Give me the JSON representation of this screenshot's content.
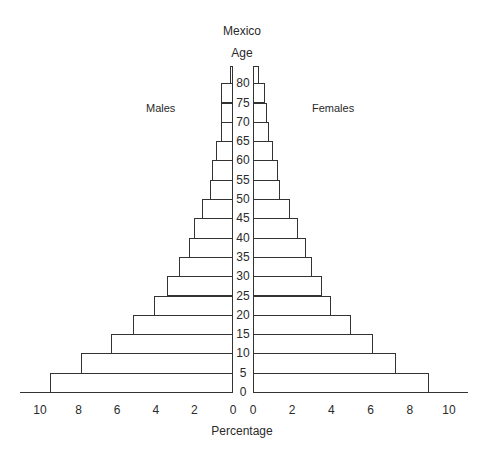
{
  "chart_data": {
    "type": "bar",
    "subtype": "population-pyramid",
    "title": "Mexico",
    "center_axis_label": "Age",
    "xlabel": "Percentage",
    "left_label": "Males",
    "right_label": "Females",
    "age_ticks": [
      "0",
      "5",
      "10",
      "15",
      "20",
      "25",
      "30",
      "35",
      "40",
      "45",
      "50",
      "55",
      "60",
      "65",
      "70",
      "75",
      "80"
    ],
    "x_ticks_left": [
      "10",
      "8",
      "6",
      "4",
      "2",
      "0"
    ],
    "x_ticks_right": [
      "0",
      "2",
      "4",
      "6",
      "8",
      "10"
    ],
    "xlim": [
      0,
      10
    ],
    "categories": [
      "0-4",
      "5-9",
      "10-14",
      "15-19",
      "20-24",
      "25-29",
      "30-34",
      "35-39",
      "40-44",
      "45-49",
      "50-54",
      "55-59",
      "60-64",
      "65-69",
      "70-74",
      "75-79",
      "80+"
    ],
    "series": [
      {
        "name": "Males",
        "values": [
          9.5,
          7.9,
          6.3,
          5.2,
          4.1,
          3.4,
          2.8,
          2.3,
          2.0,
          1.6,
          1.2,
          1.1,
          0.9,
          0.6,
          0.6,
          0.6,
          0.15
        ]
      },
      {
        "name": "Females",
        "values": [
          9.0,
          7.3,
          6.1,
          5.0,
          4.0,
          3.5,
          3.0,
          2.7,
          2.3,
          1.9,
          1.4,
          1.3,
          1.0,
          0.8,
          0.7,
          0.6,
          0.3
        ]
      }
    ],
    "grid": false,
    "legend": "none"
  }
}
